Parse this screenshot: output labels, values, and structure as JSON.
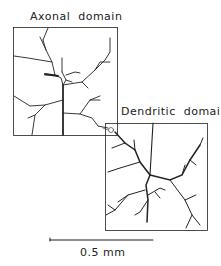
{
  "figure": {
    "axonal_label": "Axonal  domain",
    "dendritic_label": "Dendritic  domain",
    "scale_label": "0.5 mm"
  },
  "colors": {
    "line": "#222222",
    "background": "#ffffff"
  }
}
